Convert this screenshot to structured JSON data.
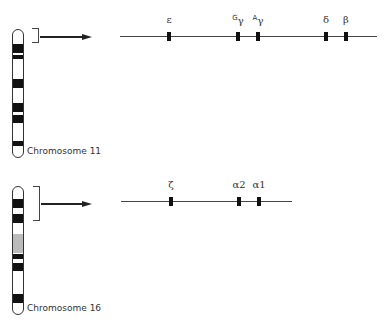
{
  "chromosomes": [
    {
      "label": "Chromosome 11",
      "top": 29,
      "bottom": 158,
      "left": 12,
      "bands": [
        {
          "y": 43,
          "h": 9,
          "color": "#111111"
        },
        {
          "y": 54,
          "h": 4,
          "color": "#111111"
        },
        {
          "y": 78,
          "h": 9,
          "color": "#111111"
        },
        {
          "y": 102,
          "h": 9,
          "color": "#111111"
        },
        {
          "y": 114,
          "h": 8,
          "color": "#111111"
        },
        {
          "y": 140,
          "h": 5,
          "color": "#111111"
        }
      ],
      "bracket": {
        "x": 32,
        "y": 28,
        "w": 7,
        "h": 15
      },
      "arrow": {
        "x1": 40,
        "x2": 92,
        "y": 36
      },
      "gene_line": {
        "x1": 120,
        "x2": 377,
        "y": 36
      },
      "genes": [
        {
          "name": "epsilon",
          "symbol": "ε",
          "sup": "",
          "x": 169
        },
        {
          "name": "G-gamma",
          "symbol": "γ",
          "sup": "G",
          "x": 238
        },
        {
          "name": "A-gamma",
          "symbol": "γ",
          "sup": "A",
          "x": 258
        },
        {
          "name": "delta",
          "symbol": "δ",
          "sup": "",
          "x": 326
        },
        {
          "name": "beta",
          "symbol": "β",
          "sup": "",
          "x": 346
        }
      ]
    },
    {
      "label": "Chromosome 16",
      "top": 186,
      "bottom": 315,
      "left": 12,
      "bands": [
        {
          "y": 198,
          "h": 9,
          "color": "#111111"
        },
        {
          "y": 213,
          "h": 9,
          "color": "#111111"
        },
        {
          "y": 233,
          "h": 19,
          "color": "#bbbbbb"
        },
        {
          "y": 253,
          "h": 5,
          "color": "#111111"
        },
        {
          "y": 262,
          "h": 8,
          "color": "#111111"
        },
        {
          "y": 293,
          "h": 9,
          "color": "#111111"
        }
      ],
      "bracket": {
        "x": 33,
        "y": 186,
        "w": 7,
        "h": 35
      },
      "arrow": {
        "x1": 41,
        "x2": 92,
        "y": 203
      },
      "gene_line": {
        "x1": 121,
        "x2": 292,
        "y": 201
      },
      "genes": [
        {
          "name": "zeta",
          "symbol": "ζ",
          "sup": "",
          "x": 171
        },
        {
          "name": "alpha2",
          "symbol": "α2",
          "sup": "",
          "x": 239
        },
        {
          "name": "alpha1",
          "symbol": "α1",
          "sup": "",
          "x": 259
        }
      ]
    }
  ]
}
